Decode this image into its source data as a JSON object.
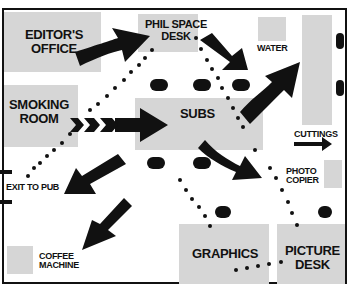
{
  "rooms": {
    "editors_office": "EDITOR'S\nOFFICE",
    "phil_space_desk": "PHIL SPACE\nDESK",
    "smoking_room": "SMOKING\nROOM",
    "subs": "SUBS",
    "graphics": "GRAPHICS",
    "picture_desk": "PICTURE\nDESK"
  },
  "labels": {
    "water": "WATER",
    "cuttings": "CUTTINGS",
    "photo_copier": "PHOTO\nCOPIER",
    "exit_to_pub": "EXIT TO PUB",
    "coffee_machine": "COFFEE\nMACHINE"
  },
  "colors": {
    "room_fill": "#d6d6d6",
    "ink": "#111111",
    "background": "#ffffff"
  }
}
